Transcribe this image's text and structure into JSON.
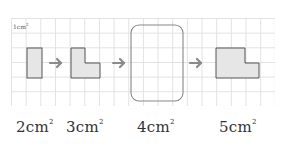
{
  "grid": {
    "unit_label": "1cm",
    "unit_exp": "2",
    "cell_size_px": 14.67,
    "line_color": "#e2e2e2"
  },
  "shapes": [
    {
      "id": "shape-1",
      "area": "2",
      "unit": "cm",
      "exp": "2"
    },
    {
      "id": "shape-2",
      "area": "3",
      "unit": "cm",
      "exp": "2"
    },
    {
      "id": "shape-3",
      "area": "4",
      "unit": "cm",
      "exp": "2",
      "blank": true
    },
    {
      "id": "shape-4",
      "area": "5",
      "unit": "cm",
      "exp": "2"
    }
  ],
  "colors": {
    "shape_fill": "#e6e6e6",
    "shape_stroke": "#555555",
    "arrow": "#8a8a8a",
    "blank_box_stroke": "#888888"
  }
}
